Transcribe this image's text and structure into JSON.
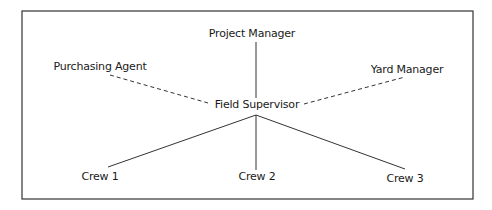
{
  "diagram": {
    "type": "organization-chart",
    "nodes": {
      "project_manager": "Project Manager",
      "purchasing_agent": "Purchasing Agent",
      "yard_manager": "Yard Manager",
      "field_supervisor": "Field Supervisor",
      "crew_1": "Crew 1",
      "crew_2": "Crew 2",
      "crew_3": "Crew 3"
    },
    "edges": [
      {
        "from": "Project Manager",
        "to": "Field Supervisor",
        "style": "solid"
      },
      {
        "from": "Purchasing Agent",
        "to": "Field Supervisor",
        "style": "dashed"
      },
      {
        "from": "Yard Manager",
        "to": "Field Supervisor",
        "style": "dashed"
      },
      {
        "from": "Field Supervisor",
        "to": "Crew 1",
        "style": "solid"
      },
      {
        "from": "Field Supervisor",
        "to": "Crew 2",
        "style": "solid"
      },
      {
        "from": "Field Supervisor",
        "to": "Crew 3",
        "style": "solid"
      }
    ],
    "colors": {
      "line": "#333333",
      "border": "#333333",
      "background": "#ffffff"
    }
  }
}
